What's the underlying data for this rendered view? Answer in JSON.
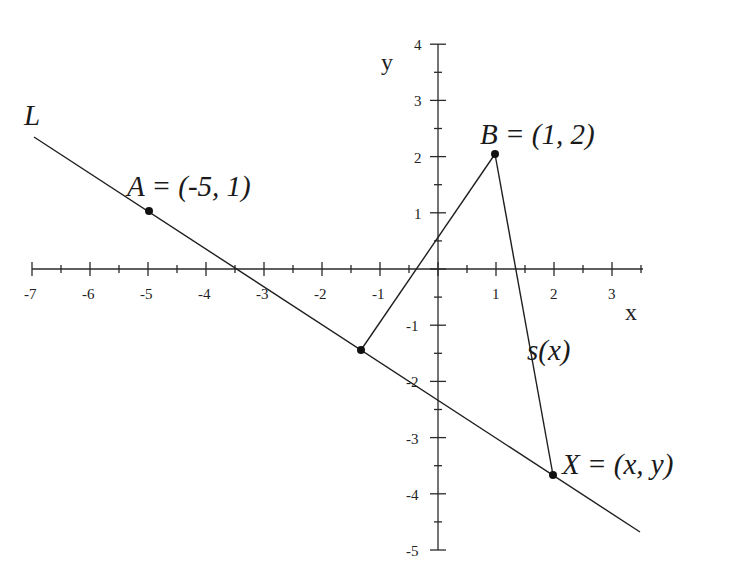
{
  "diagram": {
    "title": "",
    "axes": {
      "x_label": "x",
      "y_label": "y",
      "x_ticks": [
        "-7",
        "-6",
        "-5",
        "-4",
        "-3",
        "-2",
        "-1",
        "1",
        "2",
        "3"
      ],
      "x_tick_values": [
        -7,
        -6,
        -5,
        -4,
        -3,
        -2,
        -1,
        1,
        2,
        3
      ],
      "y_ticks": [
        "4",
        "3",
        "2",
        "1",
        "-1",
        "-2",
        "-3",
        "-4",
        "-5"
      ],
      "y_tick_values": [
        4,
        3,
        2,
        1,
        -1,
        -2,
        -3,
        -4,
        -5
      ],
      "x_range": [
        -7,
        3.5
      ],
      "y_range": [
        -5,
        4
      ]
    },
    "line": {
      "label": "L",
      "equation_slope": -0.6667,
      "equation_intercept": -2.3333
    },
    "points": {
      "A": {
        "label": "A = (-5, 1)",
        "x": -5,
        "y": 1
      },
      "B": {
        "label": "B = (1, 2)",
        "x": 1,
        "y": 2
      },
      "X": {
        "label": "X = (x, y)",
        "x": 2,
        "y": -3.667
      },
      "P": {
        "label": "",
        "x": -1.333,
        "y": -1.444
      }
    },
    "segments": {
      "s_label": "s(x)"
    },
    "colors": {
      "stroke": "#1f1f1f",
      "background": "#ffffff"
    }
  }
}
